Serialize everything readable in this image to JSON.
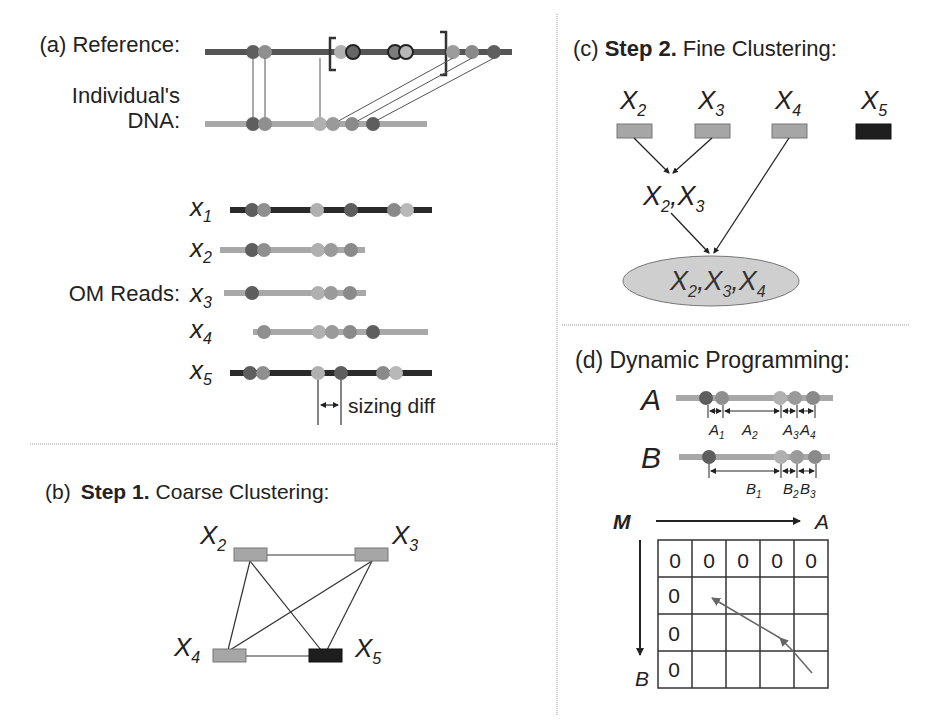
{
  "colors": {
    "reference_line": "#555555",
    "light_line": "#a8a8a8",
    "dark_read_line": "#2a2a2a",
    "dot_dark": "#5e5e5e",
    "dot_mid": "#8a8a8a",
    "dot_light": "#b4b4b4",
    "box_gray": "#a6a6a6",
    "box_black": "#1e1e1e",
    "ellipse_fill": "#cfcfcf",
    "divider": "#999999"
  },
  "panel_a": {
    "title": "(a) Reference:",
    "individual_label_line1": "Individual's",
    "individual_label_line2": "DNA:",
    "om_reads_label": "OM Reads:",
    "reads": [
      {
        "var": "x",
        "sub": "1"
      },
      {
        "var": "x",
        "sub": "2"
      },
      {
        "var": "x",
        "sub": "3"
      },
      {
        "var": "x",
        "sub": "4"
      },
      {
        "var": "x",
        "sub": "5"
      }
    ],
    "sizing_diff_label": "sizing diff"
  },
  "panel_b": {
    "prefix": "(b)",
    "step": "Step 1.",
    "title": "Coarse Clustering:",
    "nodes": [
      {
        "var": "X",
        "sub": "2"
      },
      {
        "var": "X",
        "sub": "3"
      },
      {
        "var": "X",
        "sub": "4"
      },
      {
        "var": "X",
        "sub": "5"
      }
    ]
  },
  "panel_c": {
    "prefix": "(c)",
    "step": "Step 2.",
    "title": "Fine Clustering:",
    "nodes": [
      {
        "var": "X",
        "sub": "2"
      },
      {
        "var": "X",
        "sub": "3"
      },
      {
        "var": "X",
        "sub": "4"
      },
      {
        "var": "X",
        "sub": "5"
      }
    ],
    "merge1": {
      "a": "2",
      "b": "3"
    },
    "merge2": {
      "a": "2",
      "b": "3",
      "c": "4"
    }
  },
  "panel_d": {
    "title": "(d)  Dynamic Programming:",
    "seq_a": "A",
    "seq_b": "B",
    "a_intervals": [
      {
        "var": "A",
        "sub": "1"
      },
      {
        "var": "A",
        "sub": "2"
      },
      {
        "var": "A",
        "sub": "3"
      },
      {
        "var": "A",
        "sub": "4"
      }
    ],
    "b_intervals": [
      {
        "var": "B",
        "sub": "1"
      },
      {
        "var": "B",
        "sub": "2"
      },
      {
        "var": "B",
        "sub": "3"
      }
    ],
    "matrix_label": "M",
    "axis_a": "A",
    "axis_b": "B",
    "matrix": [
      [
        "0",
        "0",
        "0",
        "0",
        "0"
      ],
      [
        "0",
        "",
        "",
        "",
        ""
      ],
      [
        "0",
        "",
        "",
        "",
        ""
      ],
      [
        "0",
        "",
        "",
        "",
        ""
      ]
    ]
  }
}
